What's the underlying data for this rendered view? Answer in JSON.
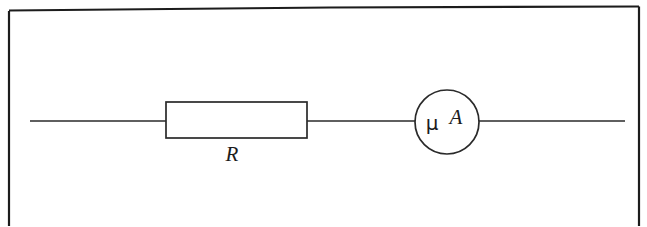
{
  "figure": {
    "kind": "circuit-diagram",
    "background_color": "#ffffff",
    "ink_color": "#1c1c1c",
    "wire_color": "#2a2a2a"
  },
  "frame": {
    "name": "figure-border",
    "visible_edges": "top-left-right",
    "bottom_cropped": true
  },
  "circuit": {
    "wire": {
      "label": "",
      "y": 121,
      "x_start": 30,
      "x_end": 625
    },
    "components": [
      {
        "type": "resistor",
        "symbol": "rectangle",
        "label": "R",
        "label_style": "italic",
        "x": 166,
        "y": 102,
        "width": 141,
        "height": 36,
        "label_x": 232,
        "label_y": 159
      },
      {
        "type": "ammeter",
        "symbol": "circle",
        "label": "μA",
        "unit_prefix": "μ",
        "unit_symbol": "A",
        "meaning": "microammeter",
        "center_x": 447,
        "center_y": 122,
        "radius": 32
      }
    ]
  }
}
